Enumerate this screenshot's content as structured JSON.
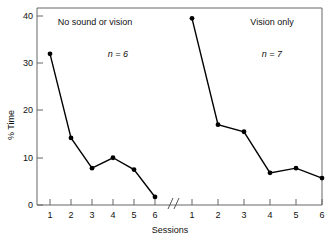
{
  "chart_data": {
    "type": "line",
    "title": "",
    "subtitle": "",
    "xlabel": "Sessions",
    "ylabel": "% Time",
    "ylim": [
      0,
      42
    ],
    "yticks": [
      0,
      10,
      20,
      30,
      40
    ],
    "ytick_labels": [
      "0",
      "10",
      "20",
      "30",
      "40"
    ],
    "grid": false,
    "legend": "none",
    "axis_break": true,
    "axis_break_symbol": "//",
    "panels": [
      {
        "name": "left-panel",
        "annotation": "No sound or vision",
        "n_label": "n = 6",
        "n_value": 6,
        "categories": [
          "1",
          "2",
          "3",
          "4",
          "5",
          "6"
        ],
        "x": [
          1,
          2,
          3,
          4,
          5,
          6
        ],
        "values": [
          32.0,
          14.2,
          7.8,
          10.0,
          7.5,
          1.7
        ]
      },
      {
        "name": "right-panel",
        "annotation": "Vision only",
        "n_label": "n = 7",
        "n_value": 7,
        "categories": [
          "1",
          "2",
          "3",
          "4",
          "5",
          "6"
        ],
        "x": [
          1,
          2,
          3,
          4,
          5,
          6
        ],
        "values": [
          39.5,
          17.0,
          15.5,
          6.8,
          7.8,
          5.7
        ]
      }
    ],
    "marker": "filled-circle",
    "marker_color": "#000000",
    "line_color": "#000000",
    "axis_color": "#555555",
    "background": "#ffffff"
  },
  "axes": {
    "ylabel": "% Time",
    "xlabel": "Sessions",
    "ytick_0": "0",
    "ytick_10": "10",
    "ytick_20": "20",
    "ytick_30": "30",
    "ytick_40": "40",
    "break_symbol": "//"
  },
  "left_panel_xticks": {
    "t1": "1",
    "t2": "2",
    "t3": "3",
    "t4": "4",
    "t5": "5",
    "t6": "6"
  },
  "right_panel_xticks": {
    "t1": "1",
    "t2": "2",
    "t3": "3",
    "t4": "4",
    "t5": "5",
    "t6": "6"
  },
  "left_annotations": {
    "condition": "No sound or vision",
    "n": "n = 6"
  },
  "right_annotations": {
    "condition": "Vision only",
    "n": "n = 7"
  }
}
